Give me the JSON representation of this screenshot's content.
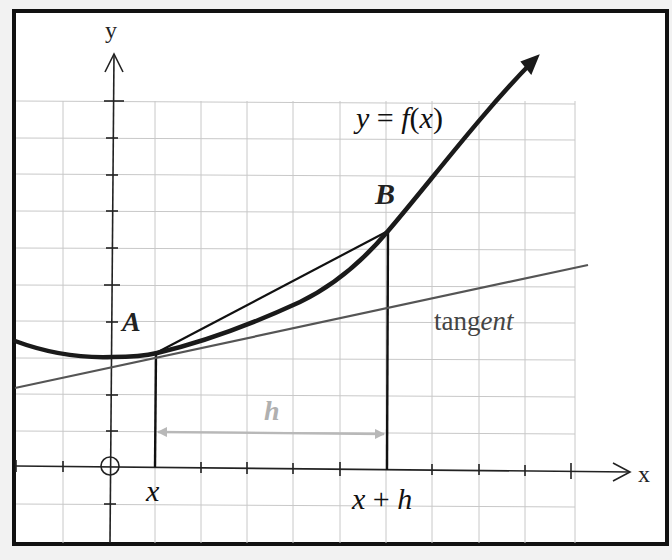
{
  "diagram": {
    "axes": {
      "x_label": "x",
      "y_label": "y",
      "origin_marker": "circle-with-cross"
    },
    "curve": {
      "label": "y = f(x)",
      "label_parts": {
        "y": "y",
        "eq": " = ",
        "f": "f",
        "open": "(",
        "x": "x",
        "close": ")"
      }
    },
    "points": {
      "A": {
        "label": "A"
      },
      "B": {
        "label": "B"
      }
    },
    "tangent": {
      "label": "tangent",
      "label_upright": "tang",
      "label_italic": "ent"
    },
    "interval": {
      "label": "h",
      "start_label": "x",
      "end_label": "x + h",
      "end_label_parts": {
        "x": "x",
        "plus": " + ",
        "h": "h"
      }
    },
    "colors": {
      "background": "#ffffff",
      "page": "#f2f2f2",
      "frame": "#111111",
      "grid": "#c8c8c8",
      "axes": "#222222",
      "curve": "#1a1a1a",
      "secant": "#111111",
      "tangent": "#555555",
      "interval_arrow": "#b8b8b8",
      "tangent_label": "#444444"
    }
  }
}
